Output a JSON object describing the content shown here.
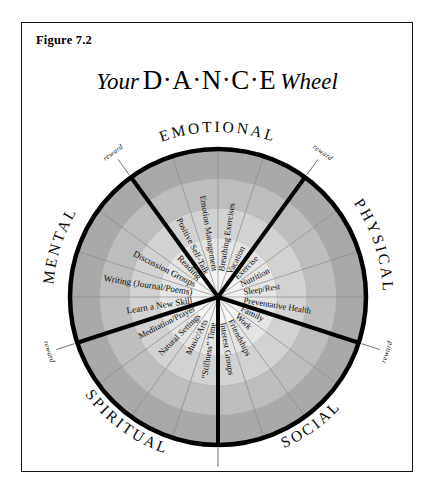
{
  "figure": {
    "label": "Figure 7.2"
  },
  "title": {
    "prefix": "Your",
    "acronym": "D·A·N·C·E",
    "suffix": "Wheel"
  },
  "colors": {
    "ink": "#0a0a0a",
    "frame_border": "#111111",
    "background": "#ffffff",
    "ring_1_innermost": "#f4f4f4",
    "ring_2": "#e4e4e4",
    "ring_3": "#d2d2d2",
    "ring_4": "#bdbdbd",
    "ring_5_outermost": "#a9a9a9",
    "outer_circle_stroke": "#000000",
    "spoke_minor": "#8a8a8a"
  },
  "chart_data": {
    "type": "pie",
    "title": "Your D·A·N·C·E Wheel",
    "legend_position": "around-perimeter",
    "grid": true,
    "rings": 5,
    "sector_count": 5,
    "items_per_sector": 4,
    "categories": [
      "EMOTIONAL",
      "PHYSICAL",
      "SOCIAL",
      "SPIRITUAL",
      "MENTAL"
    ],
    "values": [
      20,
      20,
      20,
      20,
      20
    ],
    "sectors": [
      {
        "name": "EMOTIONAL",
        "start_deg": -126,
        "end_deg": -54,
        "label_mid_deg": -90,
        "items": [
          {
            "label": "Positive Self-Talk",
            "angle_deg": -117
          },
          {
            "label": "Emotion Management",
            "angle_deg": -99
          },
          {
            "label": "Breathing Exercises",
            "angle_deg": -81
          },
          {
            "label": "Vacation",
            "angle_deg": -63
          }
        ]
      },
      {
        "name": "PHYSICAL",
        "start_deg": -54,
        "end_deg": 18,
        "label_mid_deg": -18,
        "items": [
          {
            "label": "Exercise",
            "angle_deg": -45
          },
          {
            "label": "Nutrition",
            "angle_deg": -27
          },
          {
            "label": "Sleep/Rest",
            "angle_deg": -9
          },
          {
            "label": "Preventative Health",
            "angle_deg": 9
          }
        ]
      },
      {
        "name": "SOCIAL",
        "start_deg": 18,
        "end_deg": 90,
        "label_mid_deg": 54,
        "items": [
          {
            "label": "Family",
            "angle_deg": 27
          },
          {
            "label": "Work",
            "angle_deg": 45
          },
          {
            "label": "Friendships",
            "angle_deg": 63
          },
          {
            "label": "Interest Groups",
            "angle_deg": 81
          }
        ]
      },
      {
        "name": "SPIRITUAL",
        "start_deg": 90,
        "end_deg": 162,
        "label_mid_deg": 126,
        "items": [
          {
            "label": "“Stillness” Time",
            "angle_deg": 99
          },
          {
            "label": "Music/Arts",
            "angle_deg": 117
          },
          {
            "label": "Natural Settings",
            "angle_deg": 135
          },
          {
            "label": "Meditation/Prayer",
            "angle_deg": 153
          }
        ]
      },
      {
        "name": "MENTAL",
        "start_deg": 162,
        "end_deg": 234,
        "label_mid_deg": 198,
        "items": [
          {
            "label": "Learn  a New Skill",
            "angle_deg": 171
          },
          {
            "label": "Writing (Journal/Poems)",
            "angle_deg": 189
          },
          {
            "label": "Discussion Groups",
            "angle_deg": 207
          },
          {
            "label": "Reading",
            "angle_deg": 225
          }
        ]
      }
    ],
    "rewards": [
      {
        "label": "reward",
        "angle_deg": -126
      },
      {
        "label": "reward",
        "angle_deg": -54
      },
      {
        "label": "reward",
        "angle_deg": 18
      },
      {
        "label": "reward",
        "angle_deg": 90
      },
      {
        "label": "reward",
        "angle_deg": 162
      }
    ]
  }
}
